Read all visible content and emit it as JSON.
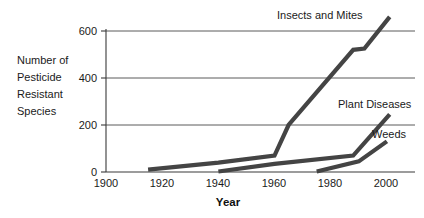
{
  "chart_data": {
    "type": "line",
    "title": "",
    "xlabel": "Year",
    "ylabel": "Number of Pesticide Resistant Species",
    "ylabel_lines": [
      "Number of",
      "Pesticide",
      "Resistant",
      "Species"
    ],
    "xlim": [
      1900,
      2010
    ],
    "ylim": [
      0,
      640
    ],
    "grid": "horizontal",
    "legend_position": "inline-labels",
    "y_ticks": [
      0,
      200,
      400,
      600
    ],
    "y_tick_labels": [
      "0",
      "200",
      "400",
      "600"
    ],
    "x_ticks": [
      1900,
      1920,
      1940,
      1960,
      1980,
      2000
    ],
    "x_tick_labels": [
      "1900",
      "1920",
      "1940",
      "1960",
      "1980",
      "2000"
    ],
    "line_color": "#444444",
    "axis_color": "#3a3a3a",
    "grid_color": "#5a5a5a",
    "series": [
      {
        "name": "Insects and Mites",
        "label": "Insects and Mites",
        "points": [
          [
            1915,
            10
          ],
          [
            1940,
            40
          ],
          [
            1960,
            70
          ],
          [
            1965,
            200
          ],
          [
            1988,
            520
          ],
          [
            1992,
            525
          ],
          [
            2001,
            660
          ]
        ]
      },
      {
        "name": "Plant Diseases",
        "label": "Plant Diseases",
        "points": [
          [
            1940,
            2
          ],
          [
            1960,
            35
          ],
          [
            1988,
            70
          ],
          [
            2001,
            245
          ]
        ]
      },
      {
        "name": "Weeds",
        "label": "Weeds",
        "points": [
          [
            1975,
            2
          ],
          [
            1990,
            45
          ],
          [
            2000,
            130
          ]
        ]
      }
    ],
    "annotations": [
      {
        "text": "Insects and Mites",
        "x": 1965,
        "y": 700
      },
      {
        "text": "Plant Diseases",
        "x": 1982,
        "y": 300
      },
      {
        "text": "Weeds",
        "x": 1988,
        "y": 185
      }
    ]
  }
}
